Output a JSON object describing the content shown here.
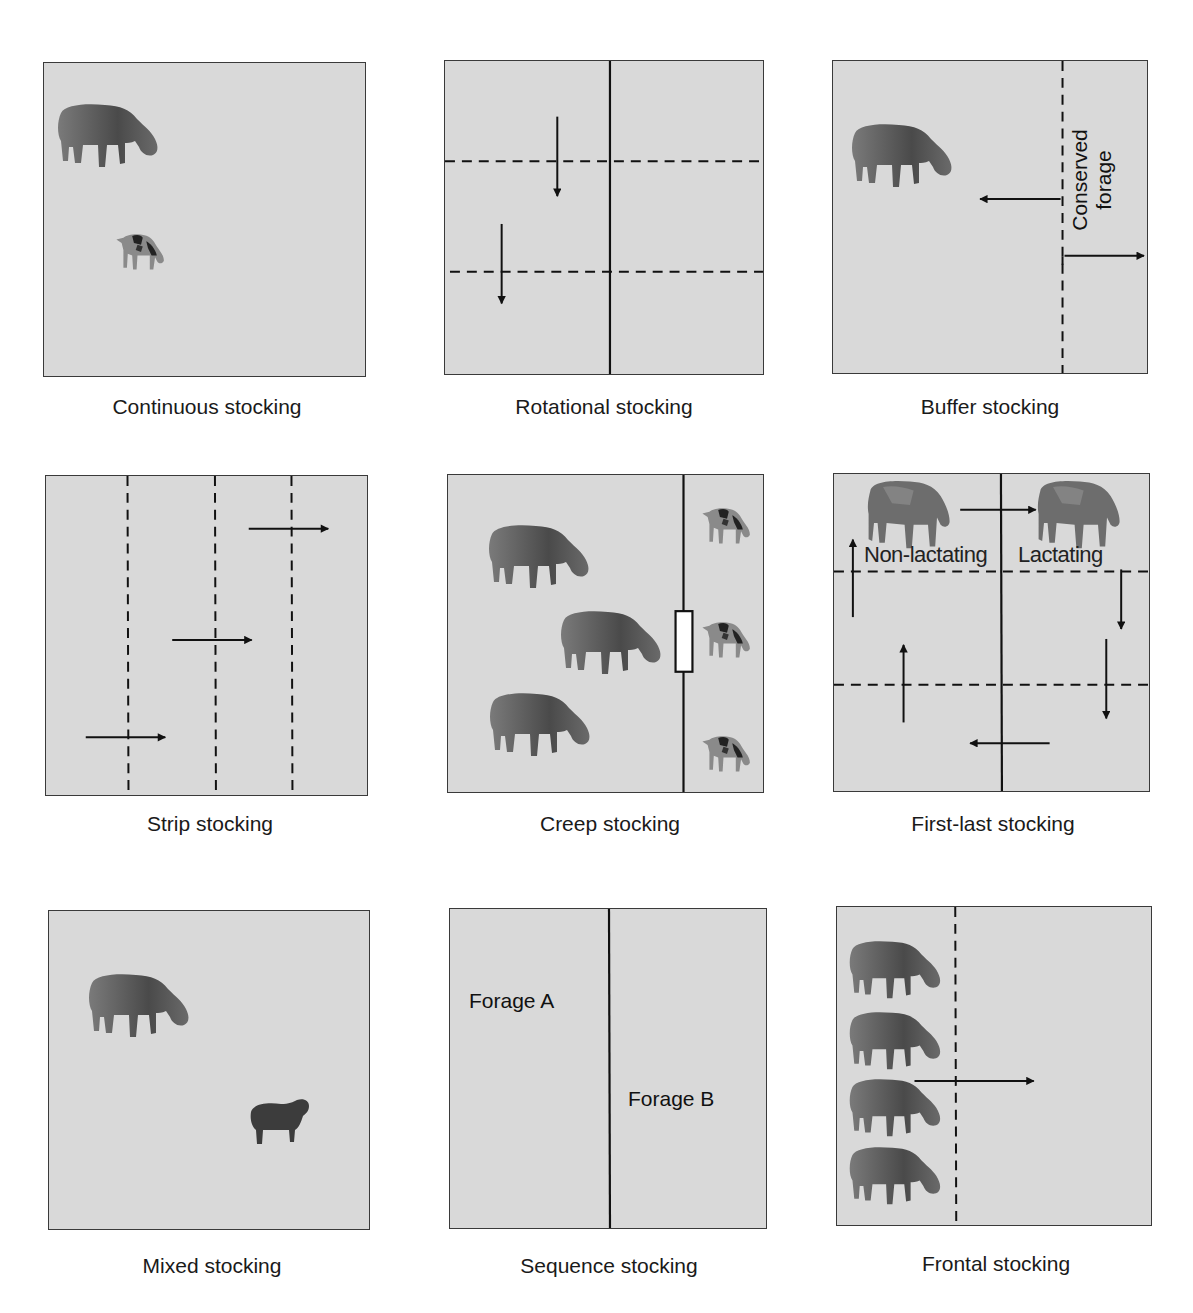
{
  "figure": {
    "type": "grazing-systems-diagram",
    "panel_color": "#d9d9d9",
    "line_color": "#111111"
  },
  "panels": [
    {
      "id": "continuous",
      "caption": "Continuous stocking",
      "animals": [
        "adult-cow",
        "calf"
      ]
    },
    {
      "id": "rotational",
      "caption": "Rotational stocking",
      "animals": []
    },
    {
      "id": "buffer",
      "caption": "Buffer stocking",
      "label_line1": "Conserved",
      "label_line2": "forage",
      "animals": [
        "adult-cow"
      ]
    },
    {
      "id": "strip",
      "caption": "Strip stocking",
      "animals": []
    },
    {
      "id": "creep",
      "caption": "Creep stocking",
      "animals": [
        "adult-cow",
        "adult-cow",
        "adult-cow",
        "calf",
        "calf",
        "calf"
      ]
    },
    {
      "id": "first-last",
      "caption": "First-last stocking",
      "label_left": "Non-lactating",
      "label_right": "Lactating",
      "animals": [
        "cow",
        "cow"
      ]
    },
    {
      "id": "mixed",
      "caption": "Mixed stocking",
      "animals": [
        "adult-cow",
        "sheep"
      ]
    },
    {
      "id": "sequence",
      "caption": "Sequence stocking",
      "label_a": "Forage A",
      "label_b": "Forage B",
      "animals": []
    },
    {
      "id": "frontal",
      "caption": "Frontal stocking",
      "animals": [
        "adult-cow",
        "adult-cow",
        "adult-cow",
        "adult-cow"
      ]
    }
  ]
}
